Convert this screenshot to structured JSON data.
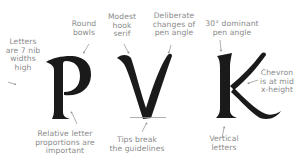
{
  "diagram": {
    "letters": [
      "P",
      "V",
      "K"
    ],
    "colors": {
      "letter_ink": "#1a1a1a",
      "annotation_text": "#8a8a8a",
      "arrow": "#9a9a9a",
      "guideline": "#9a9a9a",
      "background": "#ffffff"
    },
    "annotations": {
      "letters_height": "Letters\nare 7 nib\nwidths\nhigh",
      "round_bowls": "Round\nbowls",
      "hook_serif": "Modest\nhook\nserif",
      "pen_angle_changes": "Deliberate\nchanges of\npen angle",
      "dominant_angle": "30° dominant\npen angle",
      "chevron": "Chevron\nis at mid\nx-height",
      "proportions": "Relative letter\nproportions are\nimportant",
      "tips": "Tips break\nthe guidelines",
      "vertical": "Vertical\nletters"
    }
  }
}
